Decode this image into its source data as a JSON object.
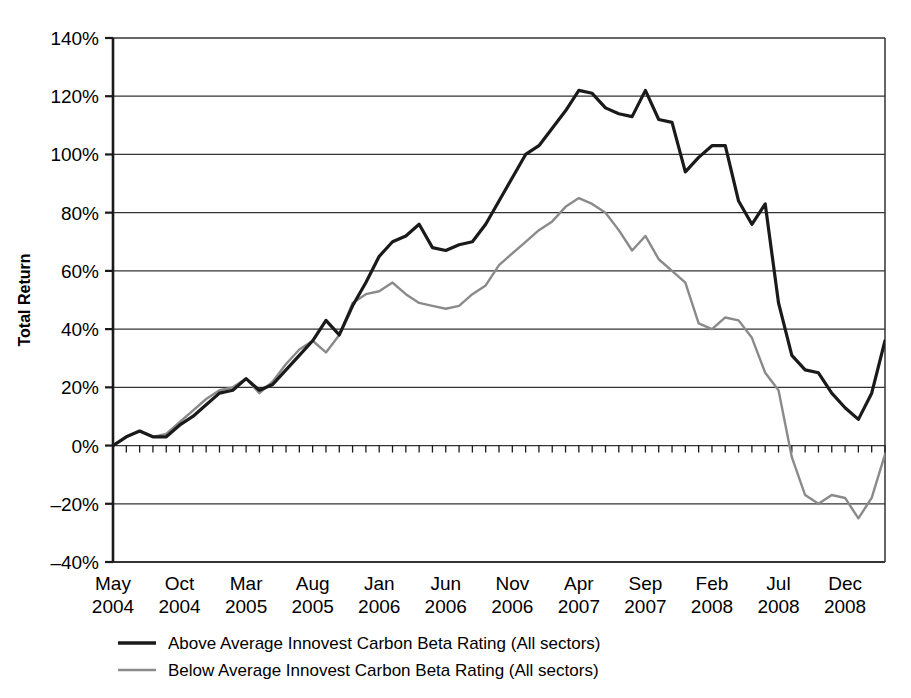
{
  "chart_data": {
    "type": "line",
    "title": "",
    "xlabel": "",
    "ylabel": "Total Return",
    "ylim": [
      -40,
      140
    ],
    "ytick_values": [
      140,
      120,
      100,
      80,
      60,
      40,
      20,
      0,
      -20,
      -40
    ],
    "ytick_labels": [
      "140%",
      "120%",
      "100%",
      "80%",
      "60%",
      "40%",
      "20%",
      "0%",
      "-20%",
      "-40%"
    ],
    "grid": true,
    "grid_axis": "y",
    "legend_position": "below",
    "x_tick_labels": [
      {
        "month": "May",
        "year": "2004",
        "index": 0
      },
      {
        "month": "Oct",
        "year": "2004",
        "index": 5
      },
      {
        "month": "Mar",
        "year": "2005",
        "index": 10
      },
      {
        "month": "Aug",
        "year": "2005",
        "index": 15
      },
      {
        "month": "Jan",
        "year": "2006",
        "index": 20
      },
      {
        "month": "Jun",
        "year": "2006",
        "index": 25
      },
      {
        "month": "Nov",
        "year": "2006",
        "index": 30
      },
      {
        "month": "Apr",
        "year": "2007",
        "index": 35
      },
      {
        "month": "Sep",
        "year": "2007",
        "index": 40
      },
      {
        "month": "Feb",
        "year": "2008",
        "index": 45
      },
      {
        "month": "Jul",
        "year": "2008",
        "index": 50
      },
      {
        "month": "Dec",
        "year": "2008",
        "index": 55
      }
    ],
    "x_index_min": 0,
    "x_index_max": 58,
    "series": [
      {
        "name": "Above Average Innovest Carbon Beta Rating (All sectors)",
        "color": "#1a1a1a",
        "width": 3.2,
        "values": [
          0,
          3,
          5,
          3,
          3,
          7,
          10,
          14,
          18,
          19,
          23,
          19,
          21,
          26,
          31,
          36,
          43,
          38,
          48,
          56,
          65,
          70,
          72,
          76,
          68,
          67,
          69,
          70,
          76,
          84,
          92,
          100,
          103,
          109,
          115,
          122,
          121,
          116,
          114,
          113,
          122,
          112,
          111,
          94,
          99,
          103,
          103,
          84,
          76,
          83,
          49,
          31,
          26,
          25,
          18,
          13,
          9,
          18,
          36
        ]
      },
      {
        "name": "Below Average Innovest Carbon Beta Rating (All sectors)",
        "color": "#8a8a8a",
        "width": 2.4,
        "values": [
          0,
          3,
          5,
          3,
          4,
          8,
          12,
          16,
          19,
          20,
          23,
          18,
          22,
          28,
          33,
          36,
          32,
          38,
          49,
          52,
          53,
          56,
          52,
          49,
          48,
          47,
          48,
          52,
          55,
          62,
          66,
          70,
          74,
          77,
          82,
          85,
          83,
          80,
          74,
          67,
          72,
          64,
          60,
          56,
          42,
          40,
          44,
          43,
          37,
          25,
          19,
          -4,
          -17,
          -20,
          -17,
          -18,
          -25,
          -18,
          -3
        ]
      }
    ]
  },
  "legend": {
    "items": [
      {
        "label": "Above Average Innovest Carbon Beta Rating (All sectors)",
        "color": "#1a1a1a"
      },
      {
        "label": "Below Average Innovest Carbon Beta Rating (All sectors)",
        "color": "#8a8a8a"
      }
    ]
  },
  "axes": {
    "y_title": "Total Return"
  }
}
